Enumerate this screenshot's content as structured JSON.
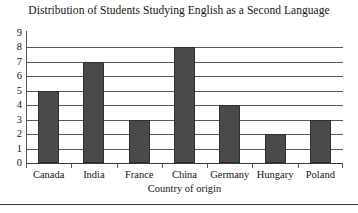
{
  "chart_data": {
    "type": "bar",
    "title": "Distribution of Students Studying English as a Second Language",
    "xlabel": "Country of origin",
    "ylabel": "",
    "categories": [
      "Canada",
      "India",
      "France",
      "China",
      "Germany",
      "Hungary",
      "Poland"
    ],
    "values": [
      5,
      7,
      3,
      8,
      4,
      2,
      3
    ],
    "ylim": [
      0,
      9
    ],
    "yticks": [
      0,
      1,
      2,
      3,
      4,
      5,
      6,
      7,
      8,
      9
    ],
    "ytick_labels": [
      "0",
      "1",
      "2",
      "3",
      "4",
      "5",
      "6",
      "7",
      "8",
      "9"
    ],
    "grid": true,
    "grid_axis": "y",
    "legend": false,
    "bar_color": "#4a4a4a",
    "bar_edge_color": "#2e2e2e",
    "axis_color": "#58585a",
    "text_color": "#141414"
  }
}
